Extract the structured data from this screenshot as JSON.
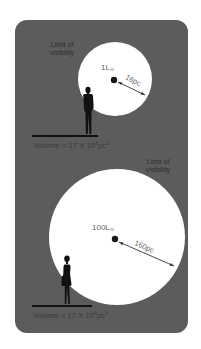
{
  "figure": {
    "background_color": "#5c5c5c",
    "circle_color": "#ffffff",
    "panels": [
      {
        "id": "top",
        "observer": "man-silhouette",
        "limit_label_line1": "Limit of",
        "limit_label_line2": "visibility",
        "luminosity_value": "1L",
        "luminosity_sub": "⊙",
        "distance_label": "16pc",
        "volume_prefix": "Volume = 17 X 10",
        "volume_exp": "3",
        "volume_unit": "pc",
        "volume_unit_exp": "3"
      },
      {
        "id": "bottom",
        "observer": "woman-silhouette",
        "limit_label_line1": "Limit of",
        "limit_label_line2": "visibility",
        "luminosity_value": "100L",
        "luminosity_sub": "⊙",
        "distance_label": "160pc",
        "volume_prefix": "Volume = 17 X 10",
        "volume_exp": "6",
        "volume_unit": "pc",
        "volume_unit_exp": "3"
      }
    ]
  }
}
